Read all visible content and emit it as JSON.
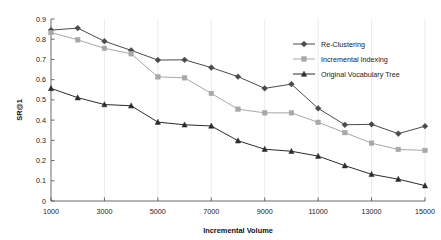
{
  "chart_data": {
    "type": "line",
    "title": "",
    "subtitle": "",
    "xlabel": "Incremental Volume",
    "ylabel": "SR@1",
    "x": [
      1000,
      2000,
      3000,
      4000,
      5000,
      6000,
      7000,
      8000,
      9000,
      10000,
      11000,
      12000,
      13000,
      14000,
      15000
    ],
    "xlim": [
      1000,
      15000
    ],
    "ylim": [
      0,
      0.9
    ],
    "xticks": [
      1000,
      3000,
      5000,
      7000,
      9000,
      11000,
      13000,
      15000
    ],
    "xtick_labels": [
      "1000",
      "3000",
      "5000",
      "7000",
      "9000",
      "11000",
      "13000",
      "15000"
    ],
    "yticks": [
      0,
      0.1,
      0.2,
      0.3,
      0.4,
      0.5,
      0.6,
      0.7,
      0.8,
      0.9
    ],
    "ytick_labels": [
      "0",
      "0.1",
      "0.2",
      "0.3",
      "0.4",
      "0.5",
      "0.6",
      "0.7",
      "0.8",
      "0.9"
    ],
    "grid": "faint-vertical",
    "legend_position": "upper-right-inside",
    "series": [
      {
        "name": "Re-Clustering",
        "marker": "diamond",
        "color": "#4a4a4a",
        "values": [
          0.845,
          0.855,
          0.79,
          0.745,
          0.697,
          0.698,
          0.66,
          0.615,
          0.557,
          0.578,
          0.458,
          0.377,
          0.379,
          0.333,
          0.37
        ]
      },
      {
        "name": "Incremental Indexing",
        "marker": "square",
        "color": "#a8a8a8",
        "values": [
          0.833,
          0.797,
          0.755,
          0.728,
          0.614,
          0.609,
          0.532,
          0.454,
          0.436,
          0.436,
          0.389,
          0.338,
          0.286,
          0.255,
          0.25
        ]
      },
      {
        "name": "Original Vocabulary Tree",
        "marker": "triangle",
        "color": "#2b2b2b",
        "values": [
          0.557,
          0.511,
          0.477,
          0.471,
          0.39,
          0.377,
          0.371,
          0.298,
          0.256,
          0.246,
          0.222,
          0.175,
          0.132,
          0.108,
          0.076
        ]
      }
    ]
  },
  "colors": {
    "background": "#ffffff",
    "axis": "#5a5a5a",
    "grid": "#e2e2e2",
    "text": "#1a1a1a"
  }
}
